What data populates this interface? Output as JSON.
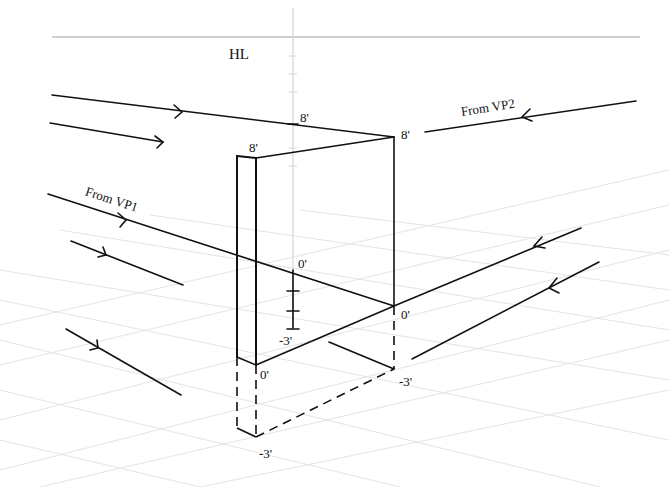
{
  "diagram": {
    "horizon_label": "HL",
    "vp_labels": {
      "vp1": "From VP1",
      "vp2": "From VP2"
    },
    "measurements": {
      "center_line_top": "8'",
      "right_corner_top": "8'",
      "left_corner_top": "8'",
      "center_ground": "0'",
      "center_below": "-3'",
      "right_corner_ground": "0'",
      "right_corner_below": "-3'",
      "left_corner_ground": "0'",
      "left_corner_below": "-3'"
    },
    "colors": {
      "ink": "#111111",
      "grid": "#d9d9d9",
      "horizon": "#cfcfcf",
      "background": "#ffffff"
    }
  }
}
